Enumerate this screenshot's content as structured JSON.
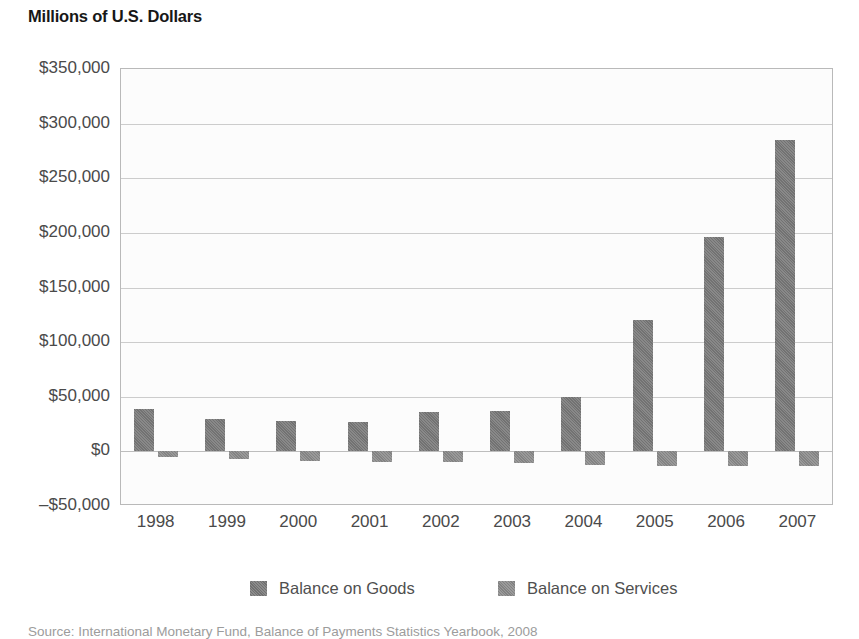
{
  "title": "Millions of U.S. Dollars",
  "source_note": "Source: International Monetary Fund, Balance of Payments Statistics Yearbook, 2008",
  "colors": {
    "goods": "#787878",
    "services": "#8a8a8a",
    "gridline": "#cccccc",
    "frame": "#b9b9b9",
    "axis_text": "#4a4a4a",
    "title_text": "#171717",
    "source_text": "#9c9c9c"
  },
  "chart_data": {
    "type": "bar",
    "title": "Millions of U.S. Dollars",
    "xlabel": "",
    "ylabel": "Millions of U.S. Dollars",
    "ylim": [
      -50000,
      350000
    ],
    "ytick_values": [
      350000,
      300000,
      250000,
      200000,
      150000,
      100000,
      50000,
      0,
      -50000
    ],
    "ytick_labels": [
      "$350,000",
      "$300,000",
      "$250,000",
      "$200,000",
      "$150,000",
      "$100,000",
      "$50,000",
      "$0",
      "–$50,000"
    ],
    "grid": true,
    "legend_position": "bottom",
    "categories": [
      "1998",
      "1999",
      "2000",
      "2001",
      "2002",
      "2003",
      "2004",
      "2005",
      "2006",
      "2007"
    ],
    "series": [
      {
        "name": "Balance on Goods",
        "values": [
          39000,
          30000,
          28000,
          27000,
          36000,
          36500,
          50000,
          120000,
          196000,
          285000
        ]
      },
      {
        "name": "Balance on Services",
        "values": [
          -5000,
          -7000,
          -8500,
          -9500,
          -10000,
          -10500,
          -12500,
          -13000,
          -13500,
          -13500
        ]
      }
    ]
  }
}
